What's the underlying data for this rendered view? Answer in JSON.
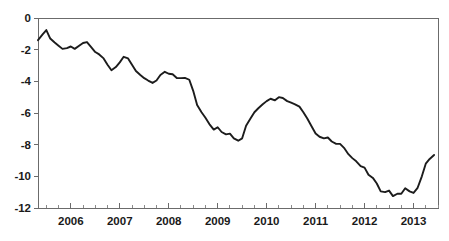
{
  "chart_data": {
    "type": "line",
    "title": "",
    "subtitle": "",
    "xlabel": "",
    "ylabel": "",
    "xlim": [
      2005.33,
      2013.5
    ],
    "ylim": [
      -12,
      0
    ],
    "grid": false,
    "legend": null,
    "y_ticks": [
      0,
      -2,
      -4,
      -6,
      -8,
      -10,
      -12
    ],
    "y_tick_labels": [
      "0",
      "-2",
      "-4",
      "-6",
      "-8",
      "-10",
      "-12"
    ],
    "x_ticks": [
      2006,
      2007,
      2008,
      2009,
      2010,
      2011,
      2012,
      2013
    ],
    "x_tick_labels": [
      "2006",
      "2007",
      "2008",
      "2009",
      "2010",
      "2011",
      "2012",
      "2013"
    ],
    "x_minor_tick_interval": 0.25,
    "line_color": "#1c1c1c",
    "axis_color": "#6b6b6b",
    "series": [
      {
        "name": "series-1",
        "x": [
          2005.33,
          2005.42,
          2005.5,
          2005.58,
          2005.67,
          2005.75,
          2005.83,
          2005.92,
          2006.0,
          2006.08,
          2006.17,
          2006.25,
          2006.33,
          2006.42,
          2006.5,
          2006.58,
          2006.67,
          2006.75,
          2006.83,
          2006.92,
          2007.0,
          2007.08,
          2007.17,
          2007.25,
          2007.33,
          2007.42,
          2007.5,
          2007.58,
          2007.67,
          2007.75,
          2007.83,
          2007.92,
          2008.0,
          2008.08,
          2008.17,
          2008.25,
          2008.33,
          2008.42,
          2008.5,
          2008.58,
          2008.67,
          2008.75,
          2008.83,
          2008.92,
          2009.0,
          2009.08,
          2009.17,
          2009.25,
          2009.33,
          2009.42,
          2009.5,
          2009.58,
          2009.67,
          2009.75,
          2009.83,
          2009.92,
          2010.0,
          2010.08,
          2010.17,
          2010.25,
          2010.33,
          2010.42,
          2010.5,
          2010.58,
          2010.67,
          2010.75,
          2010.83,
          2010.92,
          2011.0,
          2011.08,
          2011.17,
          2011.25,
          2011.33,
          2011.42,
          2011.5,
          2011.58,
          2011.67,
          2011.75,
          2011.83,
          2011.92,
          2012.0,
          2012.08,
          2012.17,
          2012.25,
          2012.33,
          2012.42,
          2012.5,
          2012.58,
          2012.67,
          2012.75,
          2012.83,
          2012.92,
          2013.0,
          2013.08,
          2013.17,
          2013.25,
          2013.33,
          2013.42
        ],
        "values": [
          -1.4,
          -1.05,
          -0.76,
          -1.3,
          -1.55,
          -1.75,
          -1.95,
          -1.9,
          -1.8,
          -1.95,
          -1.75,
          -1.58,
          -1.52,
          -1.85,
          -2.15,
          -2.3,
          -2.55,
          -2.95,
          -3.3,
          -3.1,
          -2.8,
          -2.45,
          -2.55,
          -2.95,
          -3.35,
          -3.6,
          -3.8,
          -3.95,
          -4.1,
          -3.95,
          -3.6,
          -3.4,
          -3.52,
          -3.55,
          -3.8,
          -3.8,
          -3.78,
          -3.9,
          -4.6,
          -5.5,
          -5.95,
          -6.3,
          -6.7,
          -7.05,
          -6.9,
          -7.2,
          -7.35,
          -7.3,
          -7.6,
          -7.75,
          -7.6,
          -6.8,
          -6.35,
          -5.95,
          -5.7,
          -5.45,
          -5.25,
          -5.1,
          -5.2,
          -5.0,
          -5.05,
          -5.25,
          -5.35,
          -5.45,
          -5.6,
          -5.95,
          -6.35,
          -6.85,
          -7.3,
          -7.5,
          -7.6,
          -7.55,
          -7.8,
          -7.95,
          -7.95,
          -8.2,
          -8.6,
          -8.85,
          -9.05,
          -9.35,
          -9.45,
          -9.9,
          -10.1,
          -10.45,
          -10.95,
          -11.0,
          -10.9,
          -11.25,
          -11.1,
          -11.1,
          -10.75,
          -10.95,
          -11.05,
          -10.75,
          -10.0,
          -9.2,
          -8.9,
          -8.65
        ]
      }
    ]
  },
  "figure": {
    "plot_left": 38,
    "plot_right": 438,
    "plot_top": 18,
    "plot_bottom": 208
  }
}
